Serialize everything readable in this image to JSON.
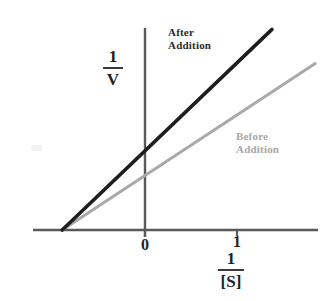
{
  "figure": {
    "background_color": "#ffffff"
  },
  "axes": {
    "y_axis_label_numerator": "1",
    "y_axis_label_denominator": "V",
    "x_axis_label_numerator": "1",
    "x_axis_label_denominator": "[S]",
    "x_tick_labels": [
      "0",
      "1"
    ],
    "axis_color": "#555555"
  },
  "series": [
    {
      "name": "after-addition",
      "label_line1": "After",
      "label_line2": "Addition",
      "color": "#1e1e1e",
      "stroke_width": 3.6
    },
    {
      "name": "before-addition",
      "label_line1": "Before",
      "label_line2": "Addition",
      "color": "#a9a9a9",
      "stroke_width": 3.0
    }
  ],
  "chart_data": {
    "type": "line",
    "xlabel": "1/[S]",
    "ylabel": "1/V",
    "grid": false,
    "legend": "inline annotations",
    "x_ticks": [
      0,
      1
    ],
    "x_tick_labels": [
      "0",
      "1"
    ],
    "y_ticks": [],
    "y_tick_labels": [],
    "xlim": [
      -1.2,
      1.9
    ],
    "ylim": [
      0,
      2.2
    ],
    "x_intercept_shared": -0.9,
    "series": [
      {
        "name": "After Addition",
        "color": "#1e1e1e",
        "x": [
          -0.9,
          1.38
        ],
        "y": [
          0.0,
          2.18
        ],
        "y_intercept": 0.86,
        "slope": 0.96,
        "note": "steeper slope, higher 1/V intercept"
      },
      {
        "name": "Before Addition",
        "color": "#a9a9a9",
        "x": [
          -0.9,
          1.85
        ],
        "y": [
          0.0,
          1.81
        ],
        "y_intercept": 0.59,
        "slope": 0.66,
        "note": "shallower slope, lower 1/V intercept, same x-intercept"
      }
    ],
    "annotations": [
      {
        "text": "After Addition",
        "x": 0.25,
        "y": 2.0
      },
      {
        "text": "Before Addition",
        "x": 0.98,
        "y": 1.1
      }
    ]
  }
}
